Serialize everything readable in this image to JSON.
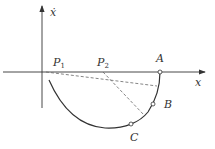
{
  "diagram": {
    "type": "phase-plane trajectory",
    "axes": {
      "x_label": "x",
      "y_label": "ẋ"
    },
    "points": [
      {
        "id": "P1",
        "label": "P",
        "subscript": "1",
        "x": 46,
        "y": 72
      },
      {
        "id": "P2",
        "label": "P",
        "subscript": "2",
        "x": 103,
        "y": 72
      },
      {
        "id": "A",
        "label": "A",
        "x": 160,
        "y": 72
      },
      {
        "id": "B",
        "label": "B",
        "x": 153,
        "y": 103
      },
      {
        "id": "C",
        "label": "C",
        "x": 131,
        "y": 124
      }
    ],
    "dashed_lines": [
      {
        "from": "P1",
        "to": "curve-near-A"
      },
      {
        "from": "P2",
        "to": "curve-near-B"
      }
    ],
    "colors": {
      "line": "#333333",
      "dashed": "#666666",
      "background": "#ffffff"
    }
  }
}
